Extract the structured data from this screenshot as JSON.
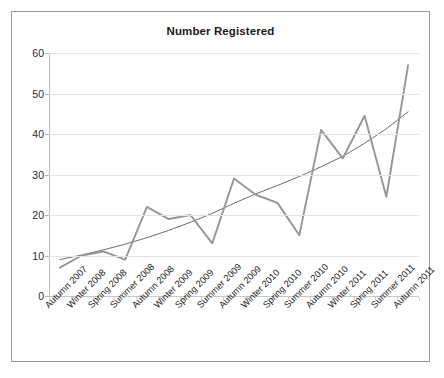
{
  "chart_data": {
    "type": "line",
    "title": "Number Registered",
    "xlabel": "",
    "ylabel": "",
    "ylim": [
      0,
      60
    ],
    "yticks": [
      0,
      10,
      20,
      30,
      40,
      50,
      60
    ],
    "grid": true,
    "legend": "none",
    "categories": [
      "Autumn 2007",
      "Winter 2008",
      "Spring 2008",
      "Summer 2008",
      "Autumn 2008",
      "Winter 2009",
      "Spring 2009",
      "Summer 2009",
      "Autumn 2009",
      "Winter 2010",
      "Spring 2010",
      "Summer 2010",
      "Autumn 2010",
      "Winter 2011",
      "Spring 2011",
      "Summer 2011",
      "Autumn 2011"
    ],
    "series": [
      {
        "name": "Number Registered",
        "color": "#969696",
        "values": [
          7,
          10,
          11,
          9,
          22,
          19,
          20,
          13,
          29,
          25,
          23,
          15,
          41,
          34,
          44.5,
          24.5,
          57
        ]
      },
      {
        "name": "Trendline",
        "color": "#595959",
        "style": "exponential",
        "values": [
          9,
          10.1,
          11.4,
          12.8,
          14.4,
          16.2,
          18.2,
          20.4,
          22.9,
          25.2,
          27.3,
          29.5,
          31.9,
          34.5,
          37.7,
          41.3,
          45.5
        ]
      }
    ],
    "colors": {
      "series_line": "#969696",
      "trend_line": "#595959",
      "gridline": "#e2e2e2",
      "axis": "#c0c0c0",
      "border": "#9a9a9a",
      "text": "#1f1f1f",
      "background": "#ffffff"
    }
  }
}
